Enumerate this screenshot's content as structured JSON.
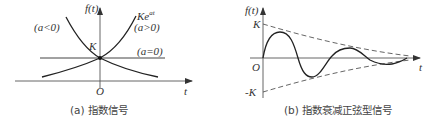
{
  "panel_a": {
    "y_axis_label": "f(t)",
    "x_axis_label": "t",
    "origin_label": "O",
    "k_label": "K",
    "curve_label_growth_main": "Ke",
    "curve_label_growth_exp": "at",
    "label_a_gt_0": "(a>0)",
    "label_a_lt_0": "(a<0)",
    "label_a_eq_0": "(a=0)",
    "caption": "(a) 指数信号"
  },
  "panel_b": {
    "y_axis_label": "f(t)",
    "x_axis_label": "t",
    "origin_label": "O",
    "k_label": "K",
    "neg_k_label": "-K",
    "caption": "(b) 指数衰减正弦型信号"
  },
  "colors": {
    "line": "#222222",
    "axis": "#555555",
    "dashed": "#555555"
  }
}
